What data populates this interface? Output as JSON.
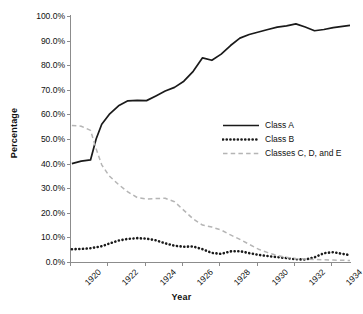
{
  "chart_data": {
    "type": "line",
    "title": "",
    "xlabel": "Year",
    "ylabel": "Percentage",
    "xlim": [
      1920,
      1935
    ],
    "ylim": [
      0,
      100
    ],
    "grid": false,
    "legend_position": "center-right",
    "x_tick_labels": [
      "1920",
      "1922",
      "1924",
      "1926",
      "1928",
      "1930",
      "1932",
      "1934"
    ],
    "x_tick_values": [
      1920,
      1922,
      1924,
      1926,
      1928,
      1930,
      1932,
      1934
    ],
    "y_tick_labels": [
      "0.0%",
      "10.0%",
      "20.0%",
      "30.0%",
      "40.0%",
      "50.0%",
      "60.0%",
      "70.0%",
      "80.0%",
      "90.0%",
      "100.0%"
    ],
    "y_tick_values": [
      0,
      10,
      20,
      30,
      40,
      50,
      60,
      70,
      80,
      90,
      100
    ],
    "x": [
      1920.1,
      1920.6,
      1921.1,
      1921.4,
      1921.7,
      1922.1,
      1922.6,
      1923.1,
      1923.6,
      1924.1,
      1924.6,
      1925.1,
      1925.6,
      1926.1,
      1926.6,
      1927.1,
      1927.6,
      1928.1,
      1928.6,
      1929.1,
      1929.6,
      1930.1,
      1930.6,
      1931.1,
      1931.6,
      1932.1,
      1932.6,
      1933.1,
      1933.6,
      1934.1,
      1934.6,
      1935.0
    ],
    "series": [
      {
        "name": "Class A",
        "style": "solid",
        "color": "#1a1a1a",
        "values": [
          40.0,
          41.0,
          41.5,
          50.0,
          56.0,
          60.0,
          63.5,
          65.5,
          65.7,
          65.6,
          67.5,
          69.5,
          71.0,
          73.5,
          77.5,
          83.0,
          82.0,
          84.5,
          88.0,
          91.0,
          92.5,
          93.5,
          94.5,
          95.5,
          96.0,
          96.8,
          95.5,
          94.0,
          94.5,
          95.3,
          95.8,
          96.2
        ]
      },
      {
        "name": "Class B",
        "style": "dotted",
        "color": "#1a1a1a",
        "values": [
          5.2,
          5.3,
          5.6,
          6.0,
          6.4,
          7.5,
          8.7,
          9.4,
          9.7,
          9.5,
          8.8,
          7.6,
          6.6,
          6.2,
          6.3,
          5.2,
          3.7,
          3.3,
          4.3,
          4.4,
          3.6,
          2.9,
          2.4,
          2.0,
          1.6,
          1.1,
          1.0,
          1.9,
          3.6,
          4.0,
          3.3,
          2.8
        ]
      },
      {
        "name": "Classes C, D, and E",
        "style": "dashed",
        "color": "#b5b5b5",
        "values": [
          55.5,
          55.2,
          53.5,
          46.0,
          39.5,
          35.0,
          31.5,
          28.5,
          26.2,
          25.6,
          25.8,
          25.9,
          24.5,
          21.0,
          17.5,
          15.0,
          14.2,
          13.0,
          11.0,
          9.2,
          7.2,
          5.2,
          3.8,
          2.6,
          1.9,
          1.4,
          1.2,
          1.0,
          0.9,
          0.8,
          0.7,
          0.6
        ]
      }
    ],
    "legend": [
      {
        "label": "Class A",
        "style": "solid",
        "color": "#1a1a1a"
      },
      {
        "label": "Class B",
        "style": "dotted",
        "color": "#1a1a1a"
      },
      {
        "label": "Classes C, D, and E",
        "style": "dashed",
        "color": "#b5b5b5"
      }
    ]
  }
}
